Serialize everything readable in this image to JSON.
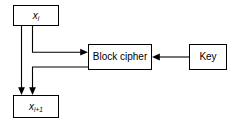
{
  "diagram": {
    "stroke_color": "#000000",
    "background_color": "#ffffff",
    "nodes": [
      {
        "id": "xi",
        "name": "input-block-node",
        "label_base": "x",
        "label_sub": "i",
        "style": "italic"
      },
      {
        "id": "xi1",
        "name": "output-block-node",
        "label_base": "x",
        "label_sub": "i+1",
        "style": "italic"
      },
      {
        "id": "block_cipher",
        "name": "block-cipher-node",
        "label": "Block cipher",
        "style": "plain"
      },
      {
        "id": "key",
        "name": "key-node",
        "label": "Key",
        "style": "plain"
      }
    ],
    "edges": [
      {
        "id": "xi-to-xi1",
        "from": "xi",
        "to": "xi1",
        "arrowhead": "down"
      },
      {
        "id": "xi-to-block-cipher",
        "from": "xi",
        "to": "block_cipher",
        "arrowhead": "right"
      },
      {
        "id": "block-cipher-to-xi1",
        "from": "block_cipher",
        "to": "xi1",
        "arrowhead": "down"
      },
      {
        "id": "key-to-block-cipher",
        "from": "key",
        "to": "block_cipher",
        "arrowhead": "left"
      }
    ]
  }
}
